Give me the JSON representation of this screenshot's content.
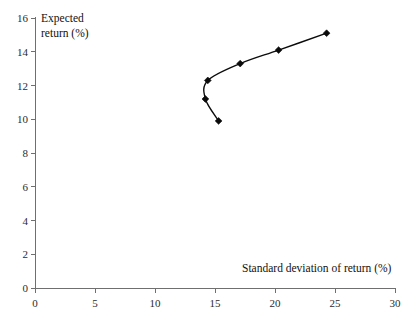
{
  "chart_data": {
    "type": "line",
    "title": "",
    "subtitle": "",
    "xlabel": "Standard deviation of return (%)",
    "ylabel": "Expected return (%)",
    "ylabel_line1": "Expected",
    "ylabel_line2": "return (%)",
    "xlim": [
      0,
      30
    ],
    "ylim": [
      0,
      16
    ],
    "xticks": [
      0,
      5,
      10,
      15,
      20,
      25,
      30
    ],
    "yticks": [
      0,
      2,
      4,
      6,
      8,
      10,
      12,
      14,
      16
    ],
    "xtick_labels": [
      "0",
      "5",
      "10",
      "15",
      "20",
      "25",
      "30"
    ],
    "ytick_labels": [
      "0",
      "2",
      "4",
      "6",
      "8",
      "10",
      "12",
      "14",
      "16"
    ],
    "grid": false,
    "legend": false,
    "legend_position": "none",
    "marker": "diamond",
    "line_color": "#0b0b0b",
    "marker_color": "#0b0b0b",
    "axis_color": "#6f6f6f",
    "background": "#ffffff",
    "series": [
      {
        "name": "Efficient frontier",
        "x": [
          15.3,
          14.2,
          14.4,
          17.1,
          20.3,
          24.3
        ],
        "y": [
          9.9,
          11.2,
          12.3,
          13.3,
          14.1,
          15.1
        ]
      }
    ],
    "points": [
      {
        "x": 15.3,
        "y": 9.9
      },
      {
        "x": 14.2,
        "y": 11.2
      },
      {
        "x": 14.4,
        "y": 12.3
      },
      {
        "x": 17.1,
        "y": 13.3
      },
      {
        "x": 20.3,
        "y": 14.1
      },
      {
        "x": 24.3,
        "y": 15.1
      }
    ]
  }
}
